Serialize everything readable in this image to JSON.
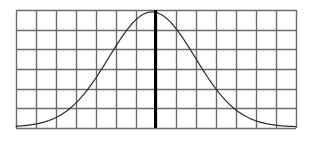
{
  "figure": {
    "name": "normal-distribution-grid-figure",
    "background_color": "#ffffff",
    "width": 311,
    "height": 141
  },
  "chart_data": {
    "type": "line",
    "title": "",
    "subtitle": "",
    "xlabel": "",
    "ylabel": "",
    "legend": [],
    "legend_position": "none",
    "grid": true,
    "grid_color": "#6b6b6b",
    "grid_line_width": 1.4,
    "grid_columns": 14,
    "grid_rows": 6,
    "plot_area": {
      "left": 16,
      "top": 10,
      "right": 296,
      "bottom": 128
    },
    "xlim": [
      0,
      14
    ],
    "ylim": [
      0,
      6
    ],
    "x_tick_labels": [],
    "y_tick_labels": [],
    "curve": {
      "name": "normal-distribution-curve",
      "shape": "gaussian",
      "color": "#2b2b2b",
      "line_width": 1.2,
      "mean_x": 6.8,
      "std_dev_x": 2.15,
      "peak_y": 5.9,
      "baseline_y": 0.05,
      "points_x": [
        0.1,
        0.5,
        1.0,
        1.5,
        2.0,
        2.5,
        3.0,
        3.5,
        4.0,
        4.5,
        5.0,
        5.5,
        6.0,
        6.4,
        6.8,
        7.2,
        7.6,
        8.0,
        8.5,
        9.0,
        9.5,
        10.0,
        10.5,
        11.0,
        11.5,
        12.0,
        12.5,
        13.0,
        13.5,
        13.95
      ],
      "points_y": [
        0.06,
        0.09,
        0.14,
        0.22,
        0.34,
        0.52,
        0.79,
        1.17,
        1.69,
        2.37,
        3.17,
        4.03,
        4.85,
        5.4,
        5.85,
        5.8,
        5.48,
        4.96,
        4.12,
        3.25,
        2.45,
        1.76,
        1.21,
        0.8,
        0.51,
        0.32,
        0.2,
        0.13,
        0.09,
        0.07
      ]
    },
    "annotations": [
      {
        "name": "mean-marker-line",
        "type": "vertical-line",
        "x": 6.95,
        "y_start": 0,
        "y_end": 6,
        "color": "#000000",
        "line_width": 3
      }
    ]
  }
}
